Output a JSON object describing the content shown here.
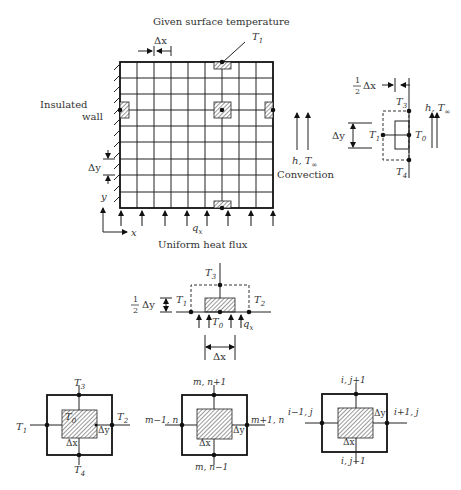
{
  "figure": {
    "top_title": "Given surface temperature",
    "bottom_title": "Uniform heat flux",
    "grid": {
      "columns": 9,
      "rows": 9
    }
  },
  "main_grid": {
    "labels": {
      "delta_x": "Δx",
      "delta_y": "Δy",
      "T1": "T",
      "T1_sub": "1",
      "insulated_line1": "Insulated",
      "insulated_line2": "wall",
      "axis_y": "y",
      "axis_x": "x",
      "q": "q",
      "q_sub": "x",
      "convection_h": "h, T",
      "convection_inf": "∞",
      "convection": "Convection"
    }
  },
  "convection_node": {
    "half": "1",
    "half_den": "2",
    "delta_x": "Δx",
    "delta_y": "Δy",
    "h": "h, T",
    "inf": "∞",
    "T": "T",
    "subs": {
      "T0": "0",
      "T1": "1",
      "T3": "3",
      "T4": "4"
    }
  },
  "flux_node": {
    "half": "1",
    "half_den": "2",
    "delta_y": "Δy",
    "delta_x": "Δx",
    "T": "T",
    "q": "q",
    "q_sub": "x",
    "subs": {
      "T0": "0",
      "T1": "1",
      "T2": "2",
      "T3": "3"
    }
  },
  "interior_nodes": [
    {
      "top": "T3",
      "left": "T1",
      "right": "T2",
      "bottom": "T4",
      "center": "T0",
      "dx": "Δx",
      "dy": "Δy"
    },
    {
      "top": "m, n+1",
      "left": "m−1, n",
      "right": "m+1, n",
      "bottom": "m, n−1",
      "dx": "Δx",
      "dy": "Δy"
    },
    {
      "top": "i, j+1",
      "left": "i−1, j",
      "right": "i+1, j",
      "bottom": "i, j−1",
      "dx": "Δx",
      "dy": "Δy"
    }
  ]
}
